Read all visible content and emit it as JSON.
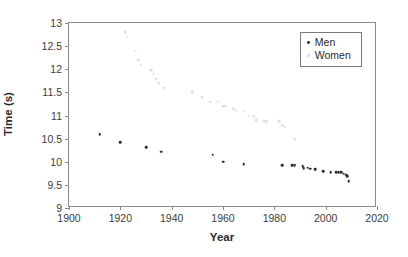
{
  "chart_data": {
    "type": "scatter",
    "title": "",
    "xlabel": "Year",
    "ylabel": "Time (s)",
    "xlim": [
      1900,
      2020
    ],
    "ylim": [
      9,
      13
    ],
    "xticks": [
      1900,
      1920,
      1940,
      1960,
      1980,
      2000,
      2020
    ],
    "yticks": [
      9,
      9.5,
      10,
      10.5,
      11,
      11.5,
      12,
      12.5,
      13
    ],
    "xtick_labels": [
      "1900",
      "1920",
      "1940",
      "1960",
      "1980",
      "2000",
      "2020"
    ],
    "ytick_labels": [
      "9",
      "9.5",
      "10",
      "10.5",
      "11",
      "11.5",
      "12",
      "12.5",
      "13"
    ],
    "grid": false,
    "legend_position": "upper right",
    "series": [
      {
        "name": "Men",
        "color": "#2d2d2d",
        "marker": "circle",
        "points": [
          [
            1912,
            10.6
          ],
          [
            1920,
            10.42
          ],
          [
            1930,
            10.31
          ],
          [
            1936,
            10.22
          ],
          [
            1956,
            10.15
          ],
          [
            1960,
            10.0
          ],
          [
            1968,
            9.95
          ],
          [
            1983,
            9.93
          ],
          [
            1987,
            9.93
          ],
          [
            1988,
            9.92
          ],
          [
            1991,
            9.9
          ],
          [
            1991.5,
            9.86
          ],
          [
            1993,
            9.87
          ],
          [
            1994,
            9.85
          ],
          [
            1996,
            9.84
          ],
          [
            1999,
            9.79
          ],
          [
            2002,
            9.78
          ],
          [
            2004,
            9.77
          ],
          [
            2005,
            9.77
          ],
          [
            2006,
            9.77
          ],
          [
            2007,
            9.74
          ],
          [
            2008,
            9.72
          ],
          [
            2008.5,
            9.69
          ],
          [
            2009,
            9.58
          ]
        ]
      },
      {
        "name": "Women",
        "color": "#dedede",
        "marker": "circle",
        "points": [
          [
            1922,
            12.8
          ],
          [
            1922.5,
            12.7
          ],
          [
            1926,
            12.4
          ],
          [
            1927,
            12.2
          ],
          [
            1928,
            12.1
          ],
          [
            1932,
            11.98
          ],
          [
            1933,
            11.9
          ],
          [
            1934,
            11.8
          ],
          [
            1935,
            11.7
          ],
          [
            1937,
            11.6
          ],
          [
            1948,
            11.5
          ],
          [
            1952,
            11.4
          ],
          [
            1955,
            11.3
          ],
          [
            1958,
            11.3
          ],
          [
            1960,
            11.2
          ],
          [
            1961,
            11.2
          ],
          [
            1964,
            11.15
          ],
          [
            1965,
            11.1
          ],
          [
            1968,
            11.08
          ],
          [
            1970,
            11.0
          ],
          [
            1972,
            10.98
          ],
          [
            1973,
            10.9
          ],
          [
            1976,
            10.88
          ],
          [
            1977,
            10.88
          ],
          [
            1982,
            10.88
          ],
          [
            1983,
            10.79
          ],
          [
            1984,
            10.76
          ],
          [
            1988,
            10.49
          ]
        ]
      }
    ]
  },
  "legend": {
    "entries": [
      {
        "label": "Men",
        "color": "#2d2d2d"
      },
      {
        "label": "Women",
        "color": "#dcdcdc"
      }
    ]
  }
}
